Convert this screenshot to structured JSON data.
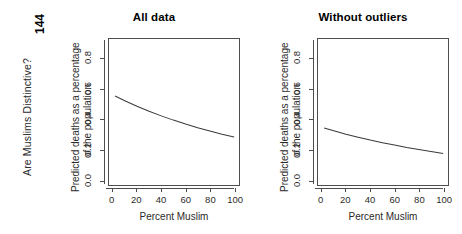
{
  "book": {
    "running_head": "Are Muslims Distinctive?",
    "page_number": "144"
  },
  "axis": {
    "x_title": "Percent Muslim",
    "y_title_line1": "Predicted deaths as a percentage",
    "y_title_line2": "of the population",
    "x_ticks": [
      "0",
      "20",
      "40",
      "60",
      "80",
      "100"
    ],
    "y_ticks": [
      "0.0",
      "0.2",
      "0.4",
      "0.6",
      "0.8"
    ]
  },
  "panels": [
    {
      "id": "all-data",
      "title": "All data"
    },
    {
      "id": "without-outliers",
      "title": "Without outliers"
    }
  ],
  "chart_data": [
    {
      "type": "line",
      "title": "All data",
      "xlabel": "Percent Muslim",
      "ylabel": "Predicted deaths as a percentage of the population",
      "xlim": [
        -3,
        104
      ],
      "ylim": [
        -0.035,
        0.93
      ],
      "xticks": [
        0,
        20,
        40,
        60,
        80,
        100
      ],
      "yticks": [
        0.0,
        0.2,
        0.4,
        0.6,
        0.8
      ],
      "grid": false,
      "legend": "none",
      "series": [
        {
          "name": "Predicted deaths",
          "x": [
            2,
            10,
            20,
            30,
            40,
            50,
            60,
            70,
            80,
            90,
            100
          ],
          "y": [
            0.553,
            0.522,
            0.486,
            0.452,
            0.422,
            0.394,
            0.368,
            0.344,
            0.322,
            0.301,
            0.282
          ]
        }
      ]
    },
    {
      "type": "line",
      "title": "Without outliers",
      "xlabel": "Percent Muslim",
      "ylabel": "Predicted deaths as a percentage of the population",
      "xlim": [
        -3,
        104
      ],
      "ylim": [
        -0.035,
        0.93
      ],
      "xticks": [
        0,
        20,
        40,
        60,
        80,
        100
      ],
      "yticks": [
        0.0,
        0.2,
        0.4,
        0.6,
        0.8
      ],
      "grid": false,
      "legend": "none",
      "series": [
        {
          "name": "Predicted deaths",
          "x": [
            2,
            10,
            20,
            30,
            40,
            50,
            60,
            70,
            80,
            90,
            100
          ],
          "y": [
            0.342,
            0.323,
            0.301,
            0.281,
            0.262,
            0.245,
            0.229,
            0.213,
            0.199,
            0.186,
            0.173
          ]
        }
      ]
    }
  ]
}
